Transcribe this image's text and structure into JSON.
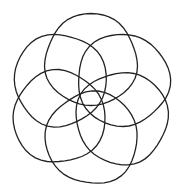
{
  "figure": {
    "stroke_color": "#222222",
    "background": "#ffffff",
    "center": [
      91,
      98
    ],
    "circles": [
      {
        "cx": 91,
        "cy": 60,
        "r": 46
      },
      {
        "cx": 123,
        "cy": 80,
        "r": 46
      },
      {
        "cx": 122,
        "cy": 118,
        "r": 46
      },
      {
        "cx": 92,
        "cy": 138,
        "r": 46
      },
      {
        "cx": 59,
        "cy": 117,
        "r": 46
      },
      {
        "cx": 60,
        "cy": 80,
        "r": 46
      }
    ]
  }
}
